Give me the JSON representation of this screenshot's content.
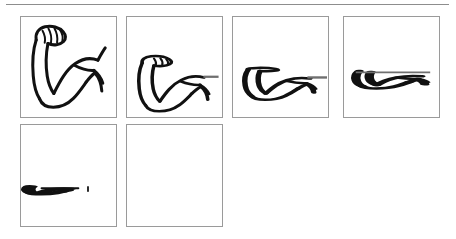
{
  "document": {
    "title": "Flexed bicep squash sequence",
    "background_color": "#ffffff",
    "width": 456,
    "height": 239
  },
  "top_rule": {
    "name": "horizontal-separator",
    "color": "#8d8d8d",
    "thickness": 1
  },
  "colors": {
    "ink": "#111111",
    "panel_border": "#9a9a9a",
    "rail": "#6f6f6f",
    "paper": "#ffffff"
  },
  "grid": {
    "columns": 4,
    "rows": 2,
    "panel_count": 6
  },
  "panels": [
    {
      "index": 1,
      "name": "frame-1",
      "label": "",
      "squash": 1.0,
      "state": "full",
      "description": "flexed bicep arm, upright fist with knuckle lines"
    },
    {
      "index": 2,
      "name": "frame-2",
      "label": "",
      "squash": 0.72,
      "state": "compressed",
      "description": "flexed bicep arm squashed vertically"
    },
    {
      "index": 3,
      "name": "frame-3",
      "label": "",
      "squash": 0.45,
      "state": "compressed",
      "description": "flexed bicep arm heavily squashed"
    },
    {
      "index": 4,
      "name": "frame-4",
      "label": "",
      "squash": 0.26,
      "state": "flattened",
      "description": "arm flattened into a shallow bowl shape"
    },
    {
      "index": 5,
      "name": "frame-5",
      "label": "",
      "squash": 0.12,
      "state": "flattened",
      "description": "arm collapsed to a thin bowl with a small speck to the right"
    },
    {
      "index": 6,
      "name": "frame-6",
      "label": "",
      "squash": 0.0,
      "state": "empty",
      "description": "empty frame"
    }
  ]
}
